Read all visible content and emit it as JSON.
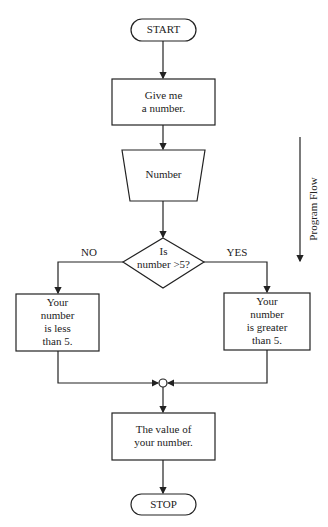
{
  "diagram": {
    "type": "flowchart",
    "nodes": {
      "start": {
        "shape": "terminal",
        "label": "START"
      },
      "input_prompt": {
        "shape": "process",
        "line1": "Give me",
        "line2": "a number."
      },
      "input": {
        "shape": "manual-input",
        "label": "Number"
      },
      "decision": {
        "shape": "decision",
        "line1": "Is",
        "line2": "number >5?"
      },
      "less": {
        "shape": "process",
        "line1": "Your",
        "line2": "number",
        "line3": "is less",
        "line4": "than 5."
      },
      "greater": {
        "shape": "process",
        "line1": "Your",
        "line2": "number",
        "line3": "is greater",
        "line4": "than 5."
      },
      "junction": {
        "shape": "connector"
      },
      "output": {
        "shape": "process",
        "line1": "The value of",
        "line2": "your number."
      },
      "stop": {
        "shape": "terminal",
        "label": "STOP"
      }
    },
    "branches": {
      "no_label": "NO",
      "yes_label": "YES"
    },
    "side_annotation": {
      "label": "Program Flow",
      "direction": "down"
    },
    "colors": {
      "stroke": "#222222",
      "background": "#ffffff"
    }
  }
}
